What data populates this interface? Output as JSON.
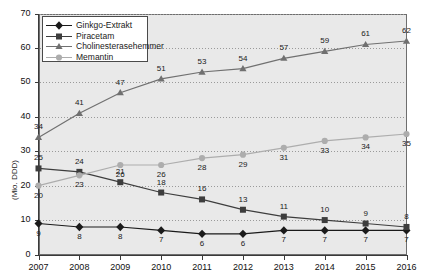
{
  "chart_data": {
    "type": "line",
    "title": "",
    "xlabel": "",
    "ylabel": "(Mio. DDD)",
    "categories": [
      "2007",
      "2008",
      "2009",
      "2010",
      "2011",
      "2012",
      "2013",
      "2014",
      "2015",
      "2016"
    ],
    "x": [
      2007,
      2008,
      2009,
      2010,
      2011,
      2012,
      2013,
      2014,
      2015,
      2016
    ],
    "ylim": [
      0,
      70
    ],
    "yticks": [
      "0",
      "10",
      "20",
      "30",
      "40",
      "50",
      "60",
      "70"
    ],
    "grid": true,
    "legend_position": "top-left",
    "series": [
      {
        "name": "Ginkgo-Extrakt",
        "marker": "diamond",
        "color": "#1a1a1a",
        "label_position": "below",
        "values": [
          9,
          8,
          8,
          7,
          6,
          6,
          7,
          7,
          7,
          7
        ]
      },
      {
        "name": "Piracetam",
        "marker": "square",
        "color": "#3d3d3d",
        "label_position": "above",
        "values": [
          25,
          24,
          21,
          18,
          16,
          13,
          11,
          10,
          9,
          8
        ]
      },
      {
        "name": "Cholinesterasehemmer",
        "marker": "triangle",
        "color": "#707070",
        "label_position": "above",
        "values": [
          34,
          41,
          47,
          51,
          53,
          54,
          57,
          59,
          61,
          62
        ]
      },
      {
        "name": "Memantin",
        "marker": "circle",
        "color": "#adadad",
        "label_position": "below",
        "values": [
          20,
          23,
          26,
          26,
          28,
          29,
          31,
          33,
          34,
          35
        ]
      }
    ]
  },
  "colors": {
    "plot_background": "#e9e9e9",
    "plot_border": "#6e6e6e",
    "gridline": "#9a9a9a",
    "page_background": "#ffffff",
    "ginkgo": "#1a1a1a",
    "piracetam": "#3d3d3d",
    "cholinesterasehemmer": "#707070",
    "memantin": "#adadad"
  }
}
